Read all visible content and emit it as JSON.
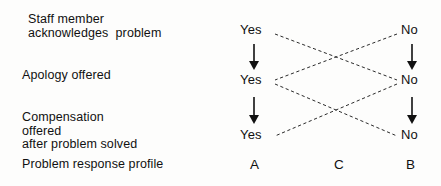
{
  "diagram": {
    "background_color": "#fdfdfc",
    "text_color": "#111111",
    "dashed_line_color": "#2b2b2b",
    "arrow_color": "#111111"
  },
  "stages": [
    {
      "id": "acknowledge",
      "lines": [
        "Staff member",
        "acknowledges  problem"
      ],
      "left_option": "Yes",
      "right_option": "No"
    },
    {
      "id": "apology",
      "lines": [
        "Apology offered"
      ],
      "left_option": "Yes",
      "right_option": "No"
    },
    {
      "id": "compensation",
      "lines": [
        "Compensation",
        "offered",
        "after problem solved"
      ],
      "left_option": "Yes",
      "right_option": "No"
    }
  ],
  "footer": {
    "label": "Problem response profile",
    "profiles": [
      {
        "letter": "A",
        "column": "left"
      },
      {
        "letter": "C",
        "column": "middle"
      },
      {
        "letter": "B",
        "column": "right"
      }
    ]
  },
  "options": {
    "row1_left": "Yes",
    "row1_right": "No",
    "row2_left": "Yes",
    "row2_right": "No",
    "row3_left": "Yes",
    "row3_right": "No"
  },
  "labels": {
    "stage1_line1": "Staff member",
    "stage1_line2": "acknowledges  problem",
    "stage2_line1": "Apology offered",
    "stage3_line1": "Compensation",
    "stage3_line2": "offered",
    "stage3_line3": "after problem solved",
    "footer_label": "Problem response profile",
    "profile_a": "A",
    "profile_c": "C",
    "profile_b": "B"
  },
  "connections": {
    "vertical_arrows": [
      {
        "from": "row1_left",
        "to": "row2_left",
        "style": "solid-arrow"
      },
      {
        "from": "row2_left",
        "to": "row3_left",
        "style": "solid-arrow"
      },
      {
        "from": "row1_right",
        "to": "row2_right",
        "style": "solid-arrow"
      },
      {
        "from": "row2_right",
        "to": "row3_right",
        "style": "solid-arrow"
      }
    ],
    "crossing_links": [
      {
        "from": "row1_left",
        "to": "row2_right",
        "style": "dashed"
      },
      {
        "from": "row1_right",
        "to": "row2_left",
        "style": "dashed"
      },
      {
        "from": "row2_left",
        "to": "row3_right",
        "style": "dashed"
      },
      {
        "from": "row2_right",
        "to": "row3_left",
        "style": "dashed"
      }
    ]
  }
}
